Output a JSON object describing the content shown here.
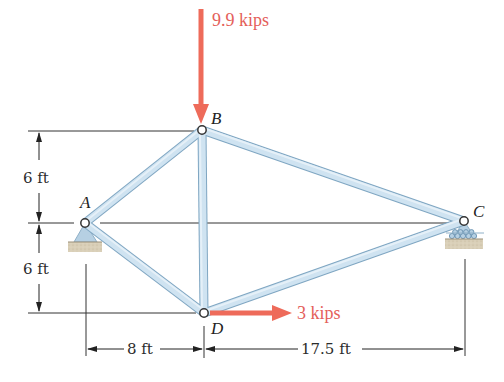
{
  "diagram": {
    "type": "truss",
    "nodes": {
      "A": {
        "label": "A",
        "x": 85,
        "y": 223
      },
      "B": {
        "label": "B",
        "x": 202,
        "y": 130
      },
      "C": {
        "label": "C",
        "x": 464,
        "y": 221
      },
      "D": {
        "label": "D",
        "x": 204,
        "y": 313
      }
    },
    "members": [
      "AB",
      "AD",
      "BD",
      "BC",
      "DC"
    ],
    "supports": {
      "A": "pin",
      "C": "roller"
    },
    "loads": {
      "B": {
        "label": "9.9 kips",
        "direction": "down"
      },
      "D": {
        "label": "3 kips",
        "direction": "right"
      }
    },
    "dimensions": {
      "vertical_upper": "6 ft",
      "vertical_lower": "6 ft",
      "horizontal_left": "8 ft",
      "horizontal_right": "17.5 ft"
    },
    "colors": {
      "member_fill": "#c9dfee",
      "member_stroke": "#7fa6c2",
      "load_arrow": "#ee6b5a",
      "load_text": "#e4605a",
      "dimension_line": "#333333",
      "ground": "#d6cbb3"
    }
  }
}
